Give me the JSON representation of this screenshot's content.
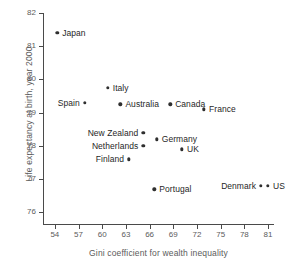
{
  "chart_data": {
    "type": "scatter",
    "title": "",
    "xlabel": "Gini coefficient for wealth inequality",
    "ylabel": "Life expectancy at birth, year 2000",
    "xlim": [
      52.5,
      81.75
    ],
    "ylim": [
      75.65,
      82.0
    ],
    "xticks": [
      54,
      57,
      60,
      63,
      66,
      69,
      72,
      75,
      78,
      81
    ],
    "yticks": [
      76,
      77,
      78,
      79,
      80,
      81,
      82
    ],
    "grid": false,
    "legend": null,
    "marker_color": "#2f2f2f",
    "axis_color": "#4a4a4a",
    "label_color": "#5b5b5b",
    "points": [
      {
        "name": "Japan",
        "x": 54.3,
        "y": 81.4,
        "label_side": "right"
      },
      {
        "name": "Spain",
        "x": 57.8,
        "y": 79.3,
        "label_side": "left"
      },
      {
        "name": "Italy",
        "x": 60.7,
        "y": 79.75,
        "label_side": "right"
      },
      {
        "name": "Australia",
        "x": 62.3,
        "y": 79.25,
        "label_side": "right"
      },
      {
        "name": "New Zealand",
        "x": 65.2,
        "y": 78.4,
        "label_side": "left"
      },
      {
        "name": "Netherlands",
        "x": 65.2,
        "y": 78.0,
        "label_side": "left"
      },
      {
        "name": "Finland",
        "x": 63.4,
        "y": 77.6,
        "label_side": "left"
      },
      {
        "name": "Germany",
        "x": 66.9,
        "y": 78.2,
        "label_side": "right"
      },
      {
        "name": "UK",
        "x": 70.1,
        "y": 77.9,
        "label_side": "right"
      },
      {
        "name": "Canada",
        "x": 68.6,
        "y": 79.25,
        "label_side": "right"
      },
      {
        "name": "France",
        "x": 72.9,
        "y": 79.1,
        "label_side": "right"
      },
      {
        "name": "Portugal",
        "x": 66.6,
        "y": 76.7,
        "label_side": "right"
      },
      {
        "name": "Denmark",
        "x": 80.1,
        "y": 76.8,
        "label_side": "left"
      },
      {
        "name": "US",
        "x": 81.0,
        "y": 76.8,
        "label_side": "right"
      }
    ]
  }
}
